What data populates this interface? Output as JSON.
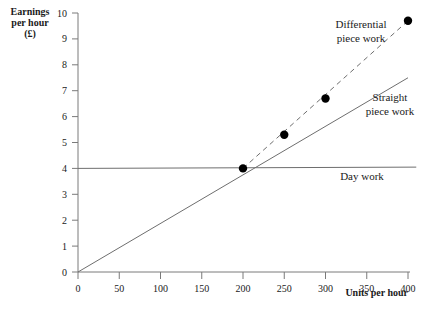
{
  "chart_data": {
    "type": "line",
    "title": "",
    "xlabel": "Units per hour",
    "ylabel": "Earnings per hour (£)",
    "ylabel_lines": [
      "Earnings",
      "per hour",
      "(£)"
    ],
    "xlim": [
      0,
      400
    ],
    "ylim": [
      0,
      10
    ],
    "grid": false,
    "legend_position": "inline-annotations",
    "xticks": [
      0,
      50,
      100,
      150,
      200,
      250,
      300,
      350,
      400
    ],
    "xtick_labels": [
      "0",
      "50",
      "100",
      "150",
      "200",
      "250",
      "300",
      "350",
      "400"
    ],
    "yticks": [
      0,
      1,
      2,
      3,
      4,
      5,
      6,
      7,
      8,
      9,
      10
    ],
    "ytick_labels": [
      "0",
      "1",
      "2",
      "3",
      "4",
      "5",
      "6",
      "7",
      "8",
      "9",
      "10"
    ],
    "series": [
      {
        "name": "Day work",
        "label": "Day work",
        "style": "solid",
        "x": [
          0,
          410
        ],
        "values": [
          4.0,
          4.05
        ]
      },
      {
        "name": "Straight piece work",
        "label": "Straight piece work",
        "label_lines": [
          "Straight",
          "piece work"
        ],
        "style": "solid",
        "x": [
          0,
          400
        ],
        "values": [
          0.0,
          7.5
        ]
      },
      {
        "name": "Differential piece work",
        "label": "Differential piece work",
        "label_lines": [
          "Differential",
          "piece work"
        ],
        "style": "dashed",
        "x": [
          200,
          400
        ],
        "values": [
          4.0,
          9.7
        ]
      }
    ],
    "points": [
      {
        "x": 200,
        "y": 4.0
      },
      {
        "x": 250,
        "y": 5.3
      },
      {
        "x": 300,
        "y": 6.7
      },
      {
        "x": 400,
        "y": 9.7
      }
    ],
    "colors": {
      "axis": "#7a7a7a",
      "line": "#6e6e6e",
      "point": "#000000",
      "text": "#1a1a1a",
      "background": "#ffffff"
    }
  },
  "labels": {
    "day_work": "Day work",
    "straight_1": "Straight",
    "straight_2": "piece work",
    "differential_1": "Differential",
    "differential_2": "piece work",
    "x_axis_title": "Units per hour",
    "y_cap_1": "Earnings",
    "y_cap_2": "per hour",
    "y_cap_3": "(£)"
  }
}
